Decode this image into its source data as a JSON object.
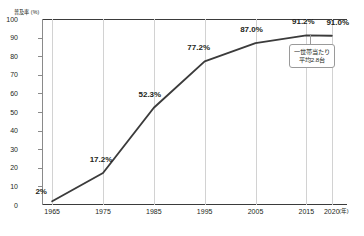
{
  "chart_data": {
    "type": "line",
    "title": "",
    "xlabel": "年",
    "ylabel": "普及率 (%)",
    "y_unit_caption": "普及率 (%)",
    "x_unit_caption": "(年)",
    "xlim": [
      1963,
      2023
    ],
    "ylim": [
      0,
      100
    ],
    "grid": "vertical",
    "legend": "none",
    "x": [
      1965,
      1975,
      1985,
      1995,
      2005,
      2015,
      2020
    ],
    "values": [
      2.0,
      17.2,
      52.3,
      77.2,
      87.0,
      91.2,
      91.0
    ],
    "point_labels": [
      "2%",
      "17.2%",
      "52.3%",
      "77.2%",
      "87.0%",
      "91.2%",
      "91.0%"
    ],
    "x_tick_labels": [
      "1965",
      "1975",
      "1985",
      "1995",
      "2005",
      "2015",
      "2020"
    ],
    "y_ticks": [
      0,
      10,
      20,
      30,
      40,
      50,
      60,
      70,
      80,
      90,
      100
    ],
    "y_tick_labels": [
      "0",
      "10",
      "20",
      "30",
      "40",
      "50",
      "60",
      "70",
      "80",
      "90",
      "100"
    ],
    "series_color": "#3b3b3b",
    "grid_color": "#d2d2d2",
    "axis_color": "#3b3b3b",
    "annotations": [
      {
        "name": "household-average-callout",
        "line1": "一世帯当たり",
        "line2": "平均2.8台",
        "attached_to_year": 2020
      }
    ]
  }
}
